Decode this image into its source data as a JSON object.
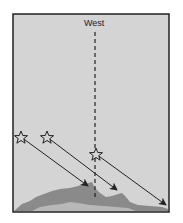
{
  "diagram": {
    "title_label": "West",
    "colors": {
      "background": "#d4d4d4",
      "frame": "#222222",
      "mountain_dark": "#8a8a8a",
      "mountain_light": "#b8b8b8",
      "lines": "#222222"
    },
    "elements": {
      "vertical_line": "dashed meridian toward West",
      "stars": 3,
      "arrows": 3
    }
  }
}
